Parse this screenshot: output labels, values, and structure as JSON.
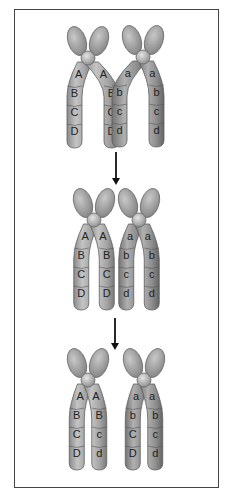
{
  "diagram": {
    "type": "meiosis-crossing-over",
    "colors": {
      "frame": "#444444",
      "chromatid_light": "#a8a8a8",
      "chromatid_dark": "#8e8e8e",
      "highlight": "#d0d0d0",
      "arrow": "#111111",
      "label": "#222222"
    },
    "stages": [
      {
        "name": "before-crossing-over",
        "chromosomes": [
          {
            "chromatids": [
              [
                "A",
                "B",
                "C",
                "D"
              ],
              [
                "A",
                "B",
                "C",
                "D"
              ]
            ]
          },
          {
            "chromatids": [
              [
                "a",
                "b",
                "c",
                "d"
              ],
              [
                "a",
                "b",
                "c",
                "d"
              ]
            ]
          }
        ]
      },
      {
        "name": "during-crossing-over",
        "chromosomes": [
          {
            "chromatids": [
              [
                "A",
                "B",
                "C",
                "D"
              ],
              [
                "A",
                "B",
                "C",
                "D"
              ]
            ]
          },
          {
            "chromatids": [
              [
                "a",
                "b",
                "c",
                "d"
              ],
              [
                "a",
                "b",
                "c",
                "d"
              ]
            ]
          }
        ]
      },
      {
        "name": "after-crossing-over",
        "chromosomes": [
          {
            "chromatids": [
              [
                "A",
                "B",
                "C",
                "D"
              ],
              [
                "A",
                "B",
                "c",
                "d"
              ]
            ]
          },
          {
            "chromatids": [
              [
                "a",
                "b",
                "C",
                "D"
              ],
              [
                "a",
                "b",
                "c",
                "d"
              ]
            ]
          }
        ]
      }
    ],
    "arrows": [
      "down-arrow",
      "down-arrow"
    ]
  }
}
